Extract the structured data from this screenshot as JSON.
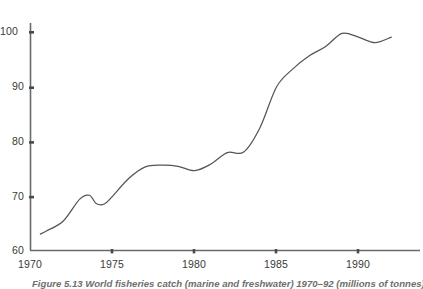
{
  "figure": {
    "caption": "Figure 5.13  World fisheries catch (marine and freshwater) 1970–92 (millions of tonnes)"
  },
  "axes": {
    "y_ticks": [
      "60",
      "70",
      "80",
      "90",
      "100"
    ],
    "x_ticks": [
      "1970",
      "1975",
      "1980",
      "1985",
      "1990"
    ]
  },
  "colors": {
    "line": "#555555",
    "axis": "#6a6a6a",
    "background": "#ffffff",
    "tick_text": "#3a3a3a",
    "caption_text": "#6e6e6e"
  },
  "chart_data": {
    "type": "line",
    "title": "World fisheries catch (marine and freshwater) 1970–92",
    "xlabel": "",
    "ylabel": "millions of tonnes",
    "xlim": [
      1970,
      1992.5
    ],
    "ylim": [
      60,
      103
    ],
    "grid": false,
    "legend": "none",
    "x_ticks": [
      1970,
      1975,
      1980,
      1985,
      1990
    ],
    "y_ticks": [
      60,
      70,
      80,
      90,
      100
    ],
    "series": [
      {
        "name": "World fisheries catch",
        "x": [
          1970.6,
          1971,
          1972,
          1973,
          1973.6,
          1974,
          1974.5,
          1975,
          1976,
          1977,
          1978,
          1979,
          1980,
          1981,
          1982,
          1983,
          1984,
          1985,
          1986,
          1987,
          1988,
          1989,
          1990,
          1991,
          1992
        ],
        "values": [
          63.0,
          63.6,
          65.4,
          69.4,
          70.1,
          68.6,
          68.5,
          69.9,
          73.2,
          75.3,
          75.6,
          75.4,
          74.6,
          75.8,
          77.9,
          78.0,
          82.5,
          89.9,
          93.2,
          95.6,
          97.3,
          99.7,
          99.0,
          98.0,
          99.0
        ]
      }
    ]
  }
}
